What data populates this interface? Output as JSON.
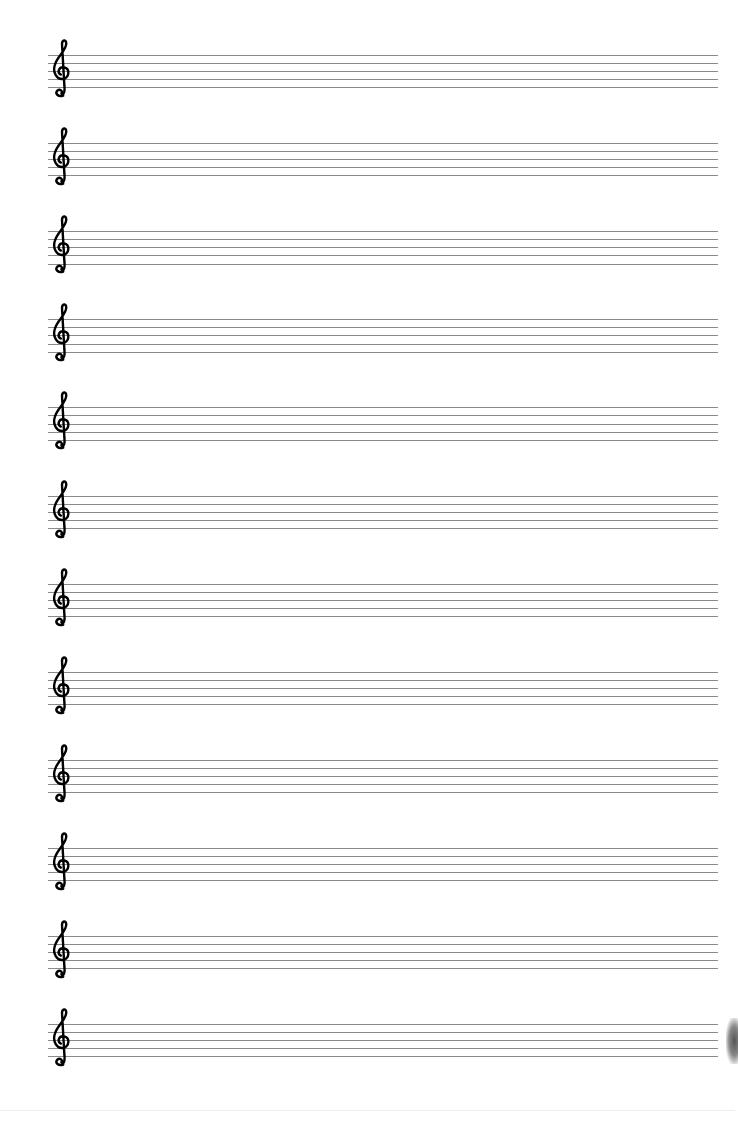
{
  "document": {
    "type": "blank manuscript paper",
    "clef": "treble-clef",
    "staff_count": 12,
    "lines_per_staff": 5,
    "colors": {
      "paper": "#ffffff",
      "staff_line": "#8a8a8a",
      "clef": "#000000"
    }
  }
}
